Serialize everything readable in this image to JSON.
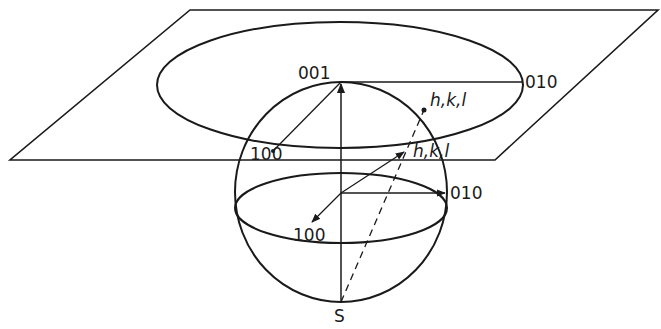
{
  "diagram": {
    "labels": {
      "pole_001": "001",
      "pole_010_plane": "010",
      "pole_100_plane": "100",
      "pole_hkl_plane": "h,k,l",
      "pole_hkl_sphere": "h,k,l",
      "pole_010_sphere": "010",
      "pole_100_sphere": "100",
      "south_pole": "S"
    },
    "colors": {
      "line": "#1a1a1a",
      "background": "#ffffff"
    }
  }
}
